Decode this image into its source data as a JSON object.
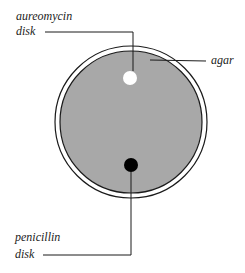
{
  "diagram": {
    "type": "petri-dish",
    "colors": {
      "background": "#ffffff",
      "agar": "#a8a8a8",
      "rim": "#1a1a1a",
      "aureomycin_disk": "#ffffff",
      "penicillin_disk": "#000000",
      "leader_line": "#1a1a1a"
    },
    "labels": {
      "aureomycin_line1": "aureomycin",
      "aureomycin_line2": "disk",
      "agar": "agar",
      "penicillin_line1": "penicillin",
      "penicillin_line2": "disk"
    }
  }
}
